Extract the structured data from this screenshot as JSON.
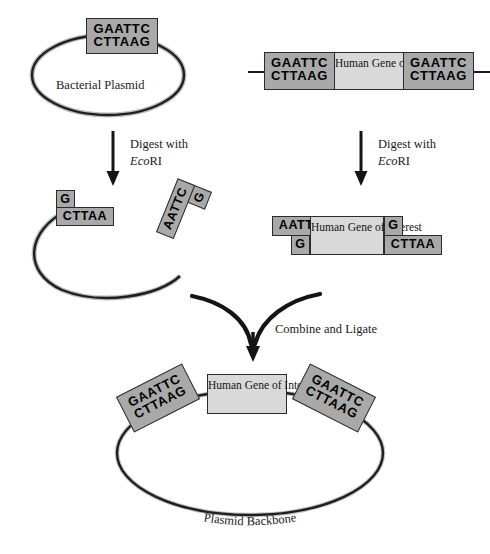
{
  "diagram": {
    "colors": {
      "seq_box_fill": "#a9a9a9",
      "gene_box_fill": "#d9d9d9",
      "stroke": "#2b2b2b",
      "text": "#1a1a1a",
      "background": "#ffffff"
    }
  },
  "sequences": {
    "top_strand_full": "GAATTC",
    "bottom_strand_full": "CTTAAG",
    "cut_left_top": "G",
    "cut_left_bottom": "CTTAA",
    "cut_right_top": "AATTC",
    "cut_right_bottom": "G"
  },
  "plasmid": {
    "label": "Bacterial Plasmid",
    "site_top": "GAATTC",
    "site_bottom": "CTTAAG"
  },
  "human_dna": {
    "gene_label_line1": "Human Gene",
    "gene_label_line2": "of Interest",
    "left_site_top": "GAATTC",
    "left_site_bottom": "CTTAAG",
    "right_site_top": "GAATTC",
    "right_site_bottom": "CTTAAG"
  },
  "digest_left": {
    "line1": "Digest with",
    "enzyme_italic": "Eco",
    "enzyme_roman": "RI"
  },
  "digest_right": {
    "line1": "Digest with",
    "enzyme_italic": "Eco",
    "enzyme_roman": "RI"
  },
  "cut_plasmid": {
    "left_end_top": "G",
    "left_end_bottom": "CTTAA",
    "right_end_top": "AATTC",
    "right_end_bottom": "G"
  },
  "cut_fragment": {
    "left_end_top": "AATTC",
    "left_end_bottom": "G",
    "gene_label_line1": "Human Gene",
    "gene_label_line2": "of Interest",
    "right_end_top": "G",
    "right_end_bottom": "CTTAA"
  },
  "combine_step": {
    "label": "Combine and Ligate"
  },
  "recombinant": {
    "left_site_top": "GAATTC",
    "left_site_bottom": "CTTAAG",
    "gene_label_line1": "Human Gene",
    "gene_label_line2": "of Interest",
    "right_site_top": "GAATTC",
    "right_site_bottom": "CTTAAG",
    "backbone_label": "Plasmid Backbone"
  }
}
